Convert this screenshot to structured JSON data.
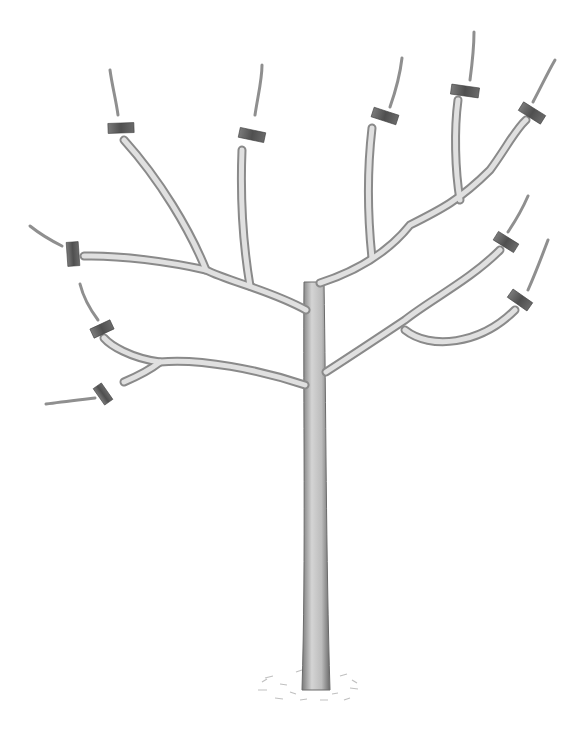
{
  "illustration": {
    "subject": "Pruned young tree with marked cut points",
    "colors": {
      "background": "#ffffff",
      "bark_light": "#d9d9d9",
      "bark_dark": "#8a8a8a",
      "outline": "#6e6e6e",
      "cut_marker": "#5e5e5e",
      "ground": "#b5b5b5"
    },
    "cut_marker_count": 10
  }
}
